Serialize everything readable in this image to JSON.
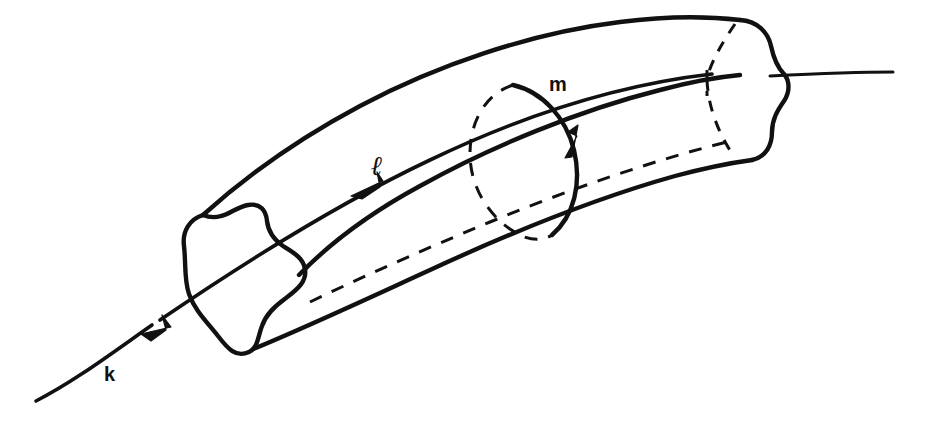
{
  "figure": {
    "background_color": "#ffffff",
    "ink_color": "#111111",
    "width": 929,
    "height": 426,
    "style": "hand-drawn line art, black ink on white"
  },
  "labels": {
    "knot_axis": "k",
    "longitude": "ℓ",
    "meridian": "m"
  },
  "label_positions": {
    "knot_axis": {
      "x": 104,
      "y": 364
    },
    "longitude": {
      "x": 371,
      "y": 152
    },
    "meridian": {
      "x": 549,
      "y": 74
    }
  },
  "elements": [
    {
      "name": "tube-body",
      "kind": "solid-torus",
      "description": "Curved tube drawn in perspective, running from lower-left to upper-right, with a rounded three-lobed (trefoil) cross-section at each end."
    },
    {
      "name": "left-end-cap",
      "kind": "lobed-cross-section",
      "lobes": 3,
      "stroke": "solid",
      "description": "Near end of the tube, open, showing a rounded three-lobed profile."
    },
    {
      "name": "right-end-cap",
      "kind": "lobed-cross-section",
      "lobes": 3,
      "stroke": "solid outline with dashed hidden arcs",
      "description": "Far end of the tube, showing a lobed profile with hidden (dashed) interior edges."
    },
    {
      "name": "knot-axis-k",
      "kind": "line-with-arrow",
      "stroke": "solid",
      "arrow_direction": "down-left",
      "description": "Core curve k passing through the tube and extending beyond both ends."
    },
    {
      "name": "longitude-l",
      "kind": "curve-with-arrow",
      "stroke": "solid (front) and dashed (back)",
      "arrow_direction": "down-left",
      "description": "Longitude ℓ drawn along the tube surface, solid on the visible front, dashed where hidden."
    },
    {
      "name": "meridian-m",
      "kind": "loop-with-arrow",
      "stroke": "solid (front) and dashed (back)",
      "arrow_direction": "up",
      "description": "Meridian m encircling the tube, solid on the near side, dashed on the far side."
    }
  ],
  "arrows": [
    {
      "name": "k-arrowhead",
      "at": {
        "x": 145,
        "y": 329
      },
      "points": "down-left"
    },
    {
      "name": "l-arrowhead",
      "at": {
        "x": 355,
        "y": 192
      },
      "points": "down-left"
    },
    {
      "name": "m-arrowhead",
      "at": {
        "x": 577,
        "y": 164
      },
      "points": "up"
    }
  ]
}
